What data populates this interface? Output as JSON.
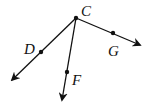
{
  "diagram": {
    "type": "rays-from-vertex",
    "vertex": {
      "label": "C",
      "x": 76,
      "y": 18,
      "label_x": 81,
      "label_y": 16
    },
    "rays": [
      {
        "name": "ray-CD",
        "point_label": "D",
        "point": {
          "x": 41,
          "y": 52
        },
        "tip": {
          "x": 12,
          "y": 80
        },
        "label_x": 24,
        "label_y": 54
      },
      {
        "name": "ray-CF",
        "point_label": "F",
        "point": {
          "x": 67,
          "y": 72
        },
        "tip": {
          "x": 62,
          "y": 100
        },
        "label_x": 72,
        "label_y": 85
      },
      {
        "name": "ray-CG",
        "point_label": "G",
        "point": {
          "x": 113,
          "y": 33
        },
        "tip": {
          "x": 140,
          "y": 45
        },
        "label_x": 108,
        "label_y": 56
      }
    ],
    "stroke_color": "#111111"
  }
}
